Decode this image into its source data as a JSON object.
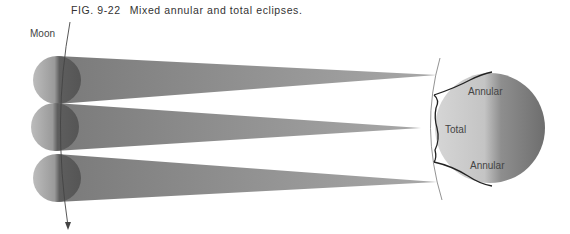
{
  "figure": {
    "number": "FIG. 9-22",
    "title": "Mixed annular and total eclipses."
  },
  "labels": {
    "moon": "Moon",
    "annular_top": "Annular",
    "total": "Total",
    "annular_bottom": "Annular"
  },
  "colors": {
    "background": "#ffffff",
    "shadow_cone": "#8a8a8a",
    "moon_light": "#b5b5b5",
    "moon_dark": "#5a5a5a",
    "earth_light": "#d0d0d0",
    "earth_dark": "#7a7a7a",
    "line": "#555555"
  }
}
